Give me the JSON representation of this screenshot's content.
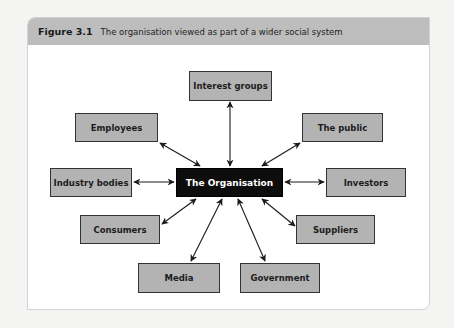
{
  "figure": {
    "number": "Figure 3.1",
    "caption": "The organisation viewed as part of a wider social system"
  },
  "diagram": {
    "center": {
      "id": "org",
      "label": "The Organisation"
    },
    "nodes": [
      {
        "id": "interest",
        "label": "Interest groups"
      },
      {
        "id": "employees",
        "label": "Employees"
      },
      {
        "id": "public",
        "label": "The public"
      },
      {
        "id": "industry",
        "label": "Industry bodies"
      },
      {
        "id": "investors",
        "label": "Investors"
      },
      {
        "id": "consumers",
        "label": "Consumers"
      },
      {
        "id": "suppliers",
        "label": "Suppliers"
      },
      {
        "id": "media",
        "label": "Media"
      },
      {
        "id": "government",
        "label": "Government"
      }
    ],
    "edges": [
      {
        "from": "org",
        "to": "interest",
        "type": "bidirectional"
      },
      {
        "from": "org",
        "to": "employees",
        "type": "bidirectional"
      },
      {
        "from": "org",
        "to": "public",
        "type": "bidirectional"
      },
      {
        "from": "org",
        "to": "industry",
        "type": "bidirectional"
      },
      {
        "from": "org",
        "to": "investors",
        "type": "bidirectional"
      },
      {
        "from": "org",
        "to": "consumers",
        "type": "bidirectional"
      },
      {
        "from": "org",
        "to": "suppliers",
        "type": "bidirectional"
      },
      {
        "from": "org",
        "to": "media",
        "type": "bidirectional"
      },
      {
        "from": "org",
        "to": "government",
        "type": "bidirectional"
      }
    ]
  },
  "colors": {
    "header_bg": "#bdbdbd",
    "node_fill": "#b3b3b3",
    "center_fill": "#0d0d0d",
    "center_text": "#ffffff",
    "arrow": "#1a1a1a"
  }
}
